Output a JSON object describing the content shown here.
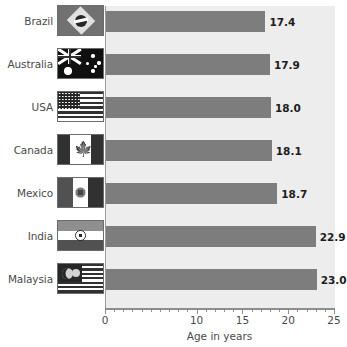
{
  "chart_data": {
    "type": "bar",
    "orientation": "horizontal",
    "title": "",
    "xlabel": "Age in years",
    "ylabel": "",
    "xlim": [
      0,
      25
    ],
    "grid": false,
    "legend": false,
    "categories": [
      "Brazil",
      "Australia",
      "USA",
      "Canada",
      "Mexico",
      "India",
      "Malaysia"
    ],
    "values": [
      17.4,
      17.9,
      18.0,
      18.1,
      18.7,
      22.9,
      23.0
    ],
    "value_labels": [
      "17.4",
      "17.9",
      "18.0",
      "18.1",
      "18.7",
      "22.9",
      "23.0"
    ],
    "x_tick_labels": [
      "0",
      "10",
      "15",
      "20",
      "25"
    ],
    "x_tick_values": [
      0,
      10,
      15,
      20,
      25
    ],
    "category_icons": [
      "flag-brazil-icon",
      "flag-australia-icon",
      "flag-usa-icon",
      "flag-canada-icon",
      "flag-mexico-icon",
      "flag-india-icon",
      "flag-malaysia-icon"
    ],
    "colors": {
      "bar": "#7d7d7d",
      "plot_background": "#ededed",
      "page_background": "#ffffff",
      "axis": "#8e8e8e",
      "text": "#4a4a4a",
      "value_text": "#1c1c1c"
    }
  }
}
